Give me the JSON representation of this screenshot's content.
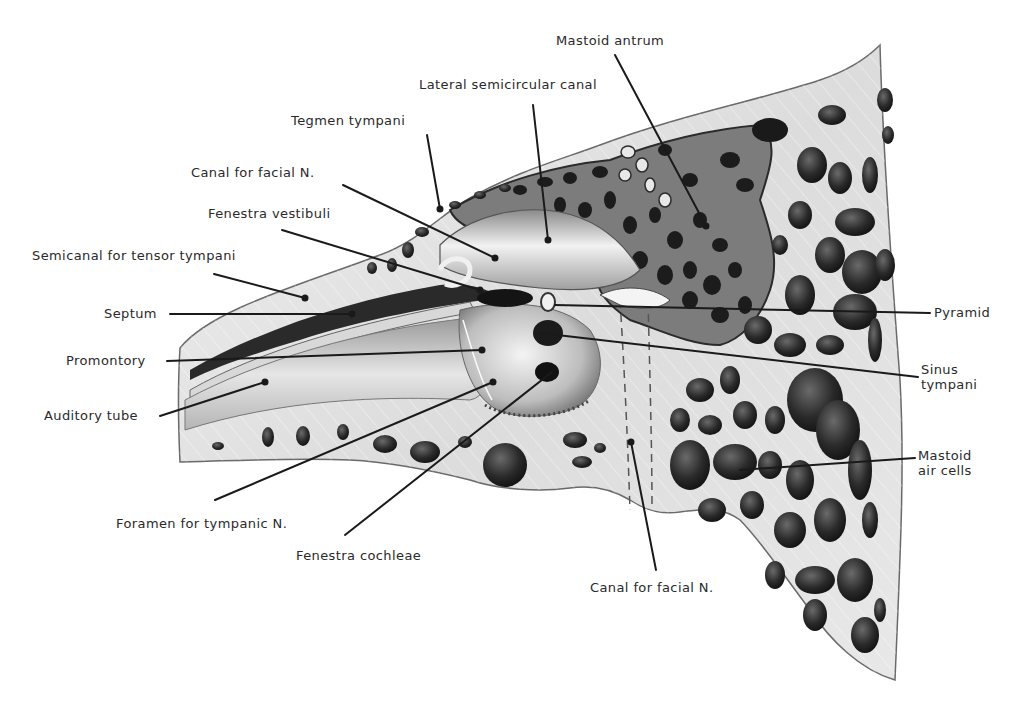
{
  "figure": {
    "colors": {
      "background": "#ffffff",
      "bone": "#e4e4e4",
      "bone_shade": "#c9c9c9",
      "air_cell": "#1e1e1e",
      "air_cell_mid": "#4a4a4a",
      "outline": "#6a6a6a",
      "leader": "#1a1a1a",
      "text": "#2a2a2a"
    }
  },
  "labels": {
    "mastoid_antrum": "Mastoid antrum",
    "lateral_semicircular_canal": "Lateral semicircular canal",
    "tegmen_tympani": "Tegmen tympani",
    "canal_facial_upper": "Canal for facial N.",
    "fenestra_vestibuli": "Fenestra vestibuli",
    "semicanal_tensor_tympani": "Semicanal for tensor tympani",
    "septum": "Septum",
    "promontory": "Promontory",
    "auditory_tube": "Auditory tube",
    "pyramid": "Pyramid",
    "sinus_tympani_line1": "Sinus",
    "sinus_tympani_line2": "tympani",
    "mastoid_air_cells_line1": "Mastoid",
    "mastoid_air_cells_line2": "air cells",
    "foramen_tympanic_n": "Foramen for tympanic N.",
    "fenestra_cochleae": "Fenestra cochleae",
    "canal_facial_lower": "Canal for facial N."
  }
}
